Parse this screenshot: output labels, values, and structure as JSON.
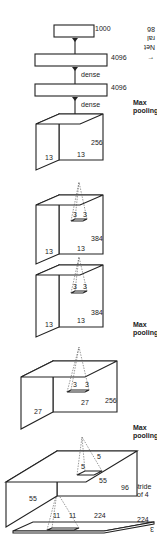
{
  "diagram": {
    "orientation": "rotated 180 degrees",
    "side_caption": [
      "←",
      "Net",
      "ral",
      "86"
    ],
    "input": {
      "width": "224",
      "height": "224",
      "depth": "3",
      "kernel": [
        "11",
        "11"
      ],
      "note_line1": "Stride",
      "note_line2": "of 4"
    },
    "layers": [
      {
        "name": "conv1",
        "w": "55",
        "h": "55",
        "depth": "96",
        "kernel": [
          "5",
          "5"
        ],
        "after_line1": "Max",
        "after_line2": "pooling"
      },
      {
        "name": "conv2",
        "w": "27",
        "h": "27",
        "depth": "256",
        "kernel": [
          "3",
          "3"
        ],
        "after_line1": "Max",
        "after_line2": "pooling"
      },
      {
        "name": "conv3",
        "w": "13",
        "h": "13",
        "depth": "384",
        "kernel": [
          "3",
          "3"
        ]
      },
      {
        "name": "conv4",
        "w": "13",
        "h": "13",
        "depth": "384",
        "kernel": [
          "3",
          "3"
        ]
      },
      {
        "name": "conv5",
        "w": "13",
        "h": "13",
        "depth": "256",
        "after_line1": "Max",
        "after_line2": "pooling"
      }
    ],
    "dense": [
      {
        "label": "dense",
        "size": "4096"
      },
      {
        "label": "dense",
        "size": "4096"
      },
      {
        "label": "",
        "size": "1000"
      }
    ]
  }
}
